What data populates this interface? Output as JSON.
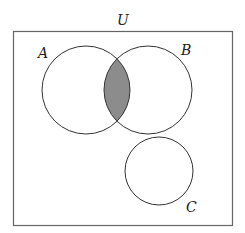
{
  "diagram": {
    "type": "venn",
    "universe_label": "U",
    "sets": [
      {
        "label": "A"
      },
      {
        "label": "B"
      },
      {
        "label": "C"
      }
    ],
    "shaded_region": "A ∩ B",
    "colors": {
      "stroke": "#333333",
      "shade": "#8c8c8c",
      "border": "#666666"
    }
  }
}
